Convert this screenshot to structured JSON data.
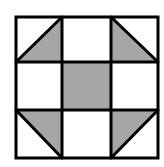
{
  "diagram": {
    "title": "",
    "type": "quilt-block-shoofly",
    "grid": {
      "rows": 3,
      "cols": 3
    },
    "colors": {
      "fill": "#a6a6a6",
      "stroke": "#000000",
      "background": "#ffffff"
    },
    "cells": [
      {
        "row": 0,
        "col": 0,
        "shape": "half-triangle",
        "shaded": "bottom-right"
      },
      {
        "row": 0,
        "col": 1,
        "shape": "square",
        "shaded": "none"
      },
      {
        "row": 0,
        "col": 2,
        "shape": "half-triangle",
        "shaded": "bottom-left"
      },
      {
        "row": 1,
        "col": 0,
        "shape": "square",
        "shaded": "none"
      },
      {
        "row": 1,
        "col": 1,
        "shape": "square",
        "shaded": "full"
      },
      {
        "row": 1,
        "col": 2,
        "shape": "square",
        "shaded": "none"
      },
      {
        "row": 2,
        "col": 0,
        "shape": "half-triangle",
        "shaded": "top-right"
      },
      {
        "row": 2,
        "col": 1,
        "shape": "square",
        "shaded": "none"
      },
      {
        "row": 2,
        "col": 2,
        "shape": "half-triangle",
        "shaded": "top-left"
      }
    ]
  }
}
